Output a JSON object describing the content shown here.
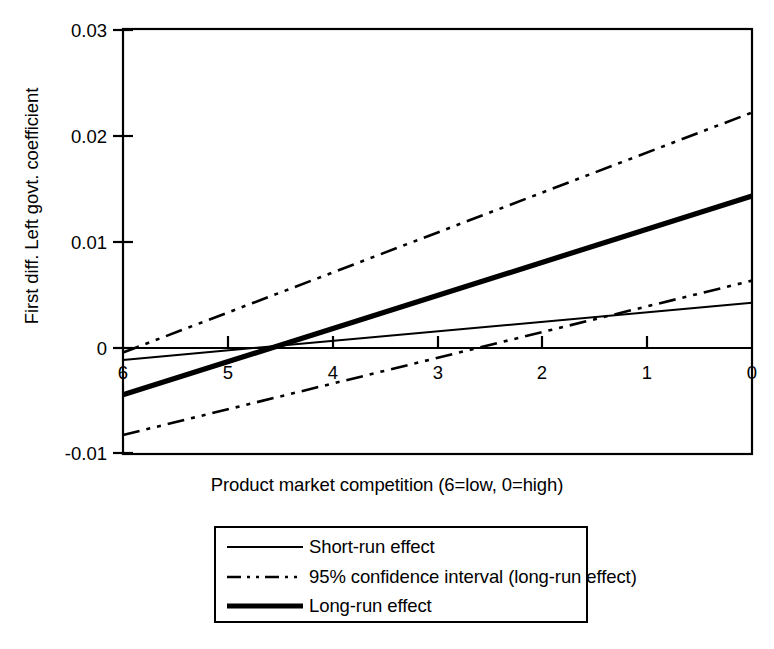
{
  "chart_data": {
    "type": "line",
    "title": "",
    "xlabel": "Product market competition (6=low, 0=high)",
    "ylabel": "First diff. Left govt. coefficient",
    "xlim": [
      6,
      0
    ],
    "ylim": [
      -0.01,
      0.03
    ],
    "x_ticks": [
      "6",
      "5",
      "4",
      "3",
      "2",
      "1",
      "0"
    ],
    "x_tick_values": [
      6,
      5,
      4,
      3,
      2,
      1,
      0
    ],
    "y_ticks": [
      "0.03",
      "0.02",
      "0.01",
      "0",
      "-0.01"
    ],
    "y_tick_values": [
      0.03,
      0.02,
      0.01,
      0,
      -0.01
    ],
    "x_axis_reversed": true,
    "grid": false,
    "zero_line": true,
    "legend_position": "below-center",
    "x": [
      6,
      0
    ],
    "series": [
      {
        "name": "Short-run effect",
        "style": "solid-thin",
        "values": [
          -0.0012,
          0.0042
        ]
      },
      {
        "name": "95% confidence interval (long-run effect)",
        "style": "dash-dot",
        "bound": "upper",
        "values": [
          -0.0005,
          0.0222
        ]
      },
      {
        "name": "95% confidence interval (long-run effect)",
        "style": "dash-dot",
        "bound": "lower",
        "values": [
          -0.0083,
          0.0063
        ]
      },
      {
        "name": "Long-run effect",
        "style": "solid-thick",
        "values": [
          -0.0045,
          0.0143
        ]
      }
    ]
  },
  "legend": {
    "items": [
      {
        "label": "Short-run effect",
        "style": "solid-thin"
      },
      {
        "label": "95% confidence interval (long-run effect)",
        "style": "dash-dot"
      },
      {
        "label": "Long-run effect",
        "style": "solid-thick"
      }
    ]
  },
  "colors": {
    "line": "#000000",
    "axis": "#000000",
    "background": "#ffffff"
  }
}
